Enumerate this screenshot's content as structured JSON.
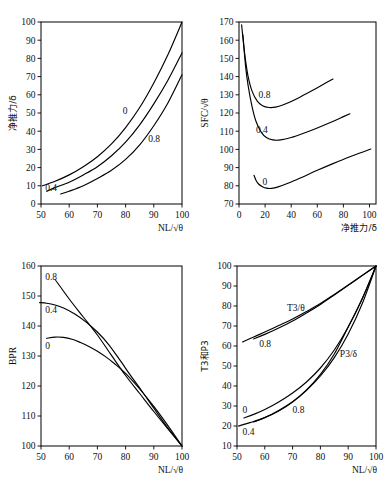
{
  "figure": {
    "kind": "multi-panel-line-chart-figure",
    "panels": 4,
    "line_color": "#000000",
    "background": "#ffffff"
  },
  "chart_data": [
    {
      "id": "panel-net-thrust",
      "type": "line",
      "title": "",
      "xlabel": "NL/√θ",
      "ylabel": "净推力/δ",
      "xlim": [
        50,
        100
      ],
      "ylim": [
        0,
        100
      ],
      "xticks": [
        50,
        60,
        70,
        80,
        90,
        100
      ],
      "yticks": [
        0,
        10,
        20,
        30,
        40,
        50,
        60,
        70,
        80,
        90,
        100
      ],
      "grid": false,
      "legend": "inline-curve-labels",
      "annotations": [
        {
          "text": "0",
          "x": 79,
          "y": 51
        },
        {
          "text": "0.4",
          "x": 51.5,
          "y": 9
        },
        {
          "text": "0.8",
          "x": 88,
          "y": 36
        }
      ],
      "series": [
        {
          "name": "0",
          "x": [
            50.5,
            55,
            60,
            65,
            70,
            75,
            80,
            85,
            90,
            95,
            100
          ],
          "y": [
            10.0,
            12.5,
            16.0,
            20.5,
            26.0,
            33.0,
            42.0,
            53.0,
            66.5,
            82.0,
            100.0
          ]
        },
        {
          "name": "0.4",
          "x": [
            52.0,
            55,
            60,
            65,
            70,
            75,
            80,
            85,
            90,
            95,
            100
          ],
          "y": [
            7.0,
            9.0,
            12.0,
            16.0,
            20.5,
            26.5,
            34.0,
            43.5,
            55.0,
            68.0,
            83.0
          ]
        },
        {
          "name": "0.8",
          "x": [
            57.0,
            60,
            65,
            70,
            75,
            80,
            85,
            90,
            95,
            100
          ],
          "y": [
            5.5,
            7.0,
            10.0,
            14.0,
            18.5,
            24.5,
            32.5,
            43.0,
            55.5,
            71.0
          ]
        }
      ]
    },
    {
      "id": "panel-sfc",
      "type": "line",
      "title": "",
      "xlabel": "净推力/δ",
      "ylabel": "SFC/√θ",
      "xlim": [
        0,
        105
      ],
      "ylim": [
        70,
        170
      ],
      "xticks": [
        0,
        20,
        40,
        60,
        80,
        100
      ],
      "yticks": [
        70,
        80,
        90,
        100,
        110,
        120,
        130,
        140,
        150,
        160,
        170
      ],
      "grid": false,
      "legend": "inline-curve-labels",
      "annotations": [
        {
          "text": "0.8",
          "x": 15,
          "y": 130
        },
        {
          "text": "0.4",
          "x": 13,
          "y": 111
        },
        {
          "text": "0",
          "x": 18,
          "y": 82
        }
      ],
      "series": [
        {
          "name": "0.8",
          "x": [
            2.0,
            3.5,
            5,
            7,
            10,
            14,
            18,
            23,
            28,
            34,
            42,
            50,
            58,
            66,
            72
          ],
          "y": [
            168.5,
            158.0,
            149.0,
            140.0,
            132.0,
            126.5,
            124.0,
            123.0,
            123.2,
            124.5,
            127.0,
            130.0,
            133.0,
            136.3,
            138.7
          ]
        },
        {
          "name": "0.4",
          "x": [
            3.0,
            5,
            7,
            10,
            13,
            17,
            21,
            26,
            32,
            40,
            50,
            60,
            70,
            80,
            85
          ],
          "y": [
            163.0,
            146.0,
            135.0,
            123.5,
            115.5,
            109.5,
            106.5,
            105.2,
            105.2,
            106.5,
            109.0,
            111.8,
            114.8,
            118.0,
            119.6
          ]
        },
        {
          "name": "0",
          "x": [
            11.5,
            13,
            15,
            18,
            21,
            25,
            30,
            38,
            48,
            60,
            72,
            85,
            95,
            101
          ],
          "y": [
            85.8,
            83.0,
            81.0,
            79.5,
            78.7,
            78.6,
            79.4,
            81.5,
            84.6,
            88.5,
            92.2,
            96.0,
            98.6,
            100.2
          ]
        }
      ]
    },
    {
      "id": "panel-bpr",
      "type": "line",
      "title": "",
      "xlabel": "NL/√θ",
      "ylabel": "BPR",
      "xlim": [
        50,
        100
      ],
      "ylim": [
        100,
        160
      ],
      "xticks": [
        50,
        60,
        70,
        80,
        90,
        100
      ],
      "yticks": [
        100,
        110,
        120,
        130,
        140,
        150,
        160
      ],
      "grid": false,
      "legend": "inline-curve-labels",
      "annotations": [
        {
          "text": "0.8",
          "x": 51.5,
          "y": 156.5
        },
        {
          "text": "0.4",
          "x": 51.5,
          "y": 145.5
        },
        {
          "text": "0",
          "x": 51.5,
          "y": 133.5
        }
      ],
      "series": [
        {
          "name": "0.8",
          "x": [
            55.0,
            60,
            65,
            70,
            75,
            80,
            85,
            90,
            95,
            100
          ],
          "y": [
            155.5,
            149.0,
            143.0,
            137.0,
            130.2,
            123.5,
            117.5,
            111.5,
            105.7,
            100.0
          ]
        },
        {
          "name": "0.4",
          "x": [
            49.5,
            52,
            55,
            58,
            62,
            66,
            70,
            74,
            78,
            82,
            86,
            90,
            95,
            100
          ],
          "y": [
            147.8,
            147.6,
            147.0,
            146.0,
            144.0,
            141.3,
            138.0,
            133.8,
            128.6,
            123.2,
            118.0,
            112.6,
            106.0,
            100.0
          ]
        },
        {
          "name": "0",
          "x": [
            52.0,
            55,
            58,
            61,
            64,
            67,
            70,
            73,
            76,
            80,
            85,
            90,
            95,
            100
          ],
          "y": [
            135.9,
            136.3,
            136.2,
            135.6,
            134.5,
            133.2,
            131.6,
            129.7,
            127.5,
            124.2,
            119.0,
            113.2,
            106.8,
            100.0
          ]
        }
      ]
    },
    {
      "id": "panel-t3-p3",
      "type": "line",
      "title": "",
      "xlabel": "NL/√θ",
      "ylabel": "T3和P3",
      "xlim": [
        50,
        100
      ],
      "ylim": [
        10,
        100
      ],
      "xticks": [
        50,
        60,
        70,
        80,
        90,
        100
      ],
      "yticks": [
        10,
        20,
        30,
        40,
        50,
        60,
        70,
        80,
        90,
        100
      ],
      "grid": false,
      "legend": "inline-curve-labels",
      "annotations": [
        {
          "text": "T3/θ",
          "x": 68,
          "y": 79
        },
        {
          "text": "0.8",
          "x": 58,
          "y": 61
        },
        {
          "text": "P3/δ",
          "x": 87,
          "y": 56
        },
        {
          "text": "0",
          "x": 52,
          "y": 28
        },
        {
          "text": "0.8",
          "x": 70,
          "y": 28
        },
        {
          "text": "0.4",
          "x": 52,
          "y": 17
        }
      ],
      "series": [
        {
          "name": "T3/theta-0",
          "x": [
            52.0,
            56,
            60,
            65,
            70,
            75,
            80,
            85,
            90,
            95,
            100
          ],
          "y": [
            62.0,
            64.5,
            67.0,
            70.2,
            73.5,
            77.2,
            81.2,
            85.8,
            90.5,
            95.2,
            100.0
          ]
        },
        {
          "name": "T3/theta-0.8",
          "x": [
            56.0,
            60,
            65,
            70,
            75,
            80,
            85,
            90,
            95,
            100
          ],
          "y": [
            63.5,
            65.8,
            69.0,
            72.5,
            76.5,
            80.8,
            85.5,
            90.3,
            95.2,
            100.0
          ]
        },
        {
          "name": "P3/delta-0",
          "x": [
            52.5,
            56,
            60,
            65,
            70,
            75,
            80,
            85,
            90,
            95,
            100
          ],
          "y": [
            24.0,
            25.8,
            28.2,
            32.0,
            36.5,
            42.0,
            49.0,
            58.0,
            69.5,
            83.5,
            100.0
          ]
        },
        {
          "name": "P3/delta-0.8",
          "x": [
            56.0,
            60,
            65,
            70,
            75,
            80,
            85,
            90,
            95,
            100
          ],
          "y": [
            22.0,
            24.2,
            27.8,
            32.2,
            37.8,
            45.0,
            54.2,
            66.0,
            81.0,
            100.0
          ]
        },
        {
          "name": "P3/delta-0.4",
          "x": [
            50.5,
            55,
            60,
            65,
            70,
            75,
            80,
            85,
            90,
            95,
            100
          ],
          "y": [
            20.0,
            21.8,
            24.2,
            27.5,
            32.0,
            38.0,
            45.8,
            56.0,
            69.5,
            83.5,
            100.0
          ]
        }
      ]
    }
  ]
}
